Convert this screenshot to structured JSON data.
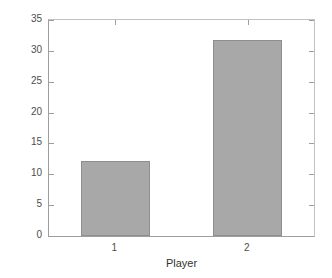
{
  "chart_data": {
    "type": "bar",
    "title": "",
    "subtitle": "",
    "xlabel": "Player",
    "ylabel": "Cost",
    "categories": [
      "1",
      "2"
    ],
    "values": [
      12.2,
      31.8
    ],
    "series": [
      {
        "name": "Cost",
        "values": [
          12.2,
          31.8
        ]
      }
    ],
    "ylim": [
      0,
      35
    ],
    "xlim": [
      0.5,
      2.5
    ],
    "yticks": [
      0,
      5,
      10,
      15,
      20,
      25,
      30,
      35
    ],
    "ytick_labels": [
      "0",
      "5",
      "10",
      "15",
      "20",
      "25",
      "30",
      "35"
    ],
    "xticks": [
      1,
      2
    ],
    "xtick_labels": [
      "1",
      "2"
    ],
    "grid": false,
    "legend": null,
    "legend_position": "none",
    "annotations": [],
    "bar_fill_color": "#a8a8a8",
    "bar_edge_color": "#8e8e8e",
    "axis_color": "#9e9e9e",
    "background_color": "#ffffff",
    "text_color": "#4d4d4d"
  }
}
